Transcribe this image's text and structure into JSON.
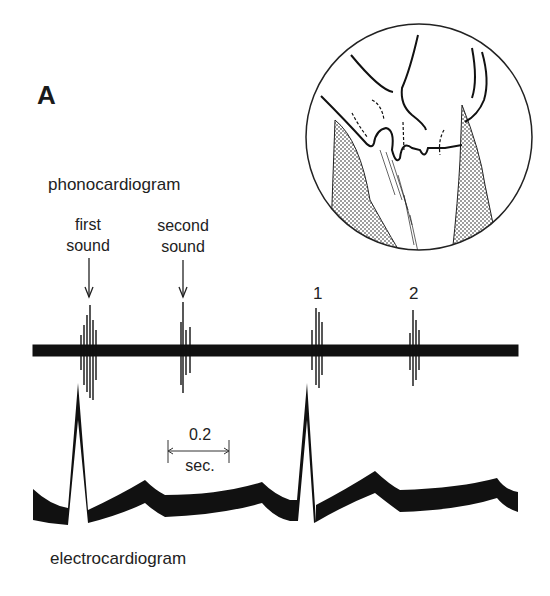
{
  "figure": {
    "panel_letter": "A",
    "phonocardiogram_label": "phonocardiogram",
    "electrocardiogram_label": "electrocardiogram",
    "annotations": {
      "first_sound": [
        "first",
        "sound"
      ],
      "second_sound": [
        "second",
        "sound"
      ],
      "marker_1": "1",
      "marker_2": "2"
    },
    "scale_bar": {
      "value": "0.2",
      "unit": "sec."
    },
    "inset": {
      "description": "circular cutaway drawing of heart valves"
    },
    "colors": {
      "ink": "#111111",
      "background": "#ffffff"
    }
  }
}
